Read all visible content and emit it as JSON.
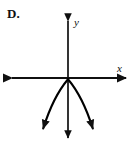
{
  "figure": {
    "choice_label": "D.",
    "colors": {
      "ink": "#101010",
      "background": "#ffffff",
      "curve": "#000000"
    },
    "axes": {
      "x_label": "x",
      "y_label": "y",
      "origin": {
        "x": 68,
        "y": 78
      },
      "x_axis": {
        "x1": 9,
        "y1": 78,
        "x2": 129,
        "y2": 78,
        "left_arrow": true,
        "right_arrow": true
      },
      "y_axis": {
        "x1": 68,
        "y1": 18,
        "x2": 68,
        "y2": 141,
        "top_arrow": true,
        "bottom_arrow": true
      }
    },
    "curve": {
      "type": "parabola",
      "opens": "down",
      "vertex": {
        "x": 0,
        "y": 0
      },
      "equation": "y = -a x^2",
      "left_branch_arrow": true,
      "right_branch_arrow": true,
      "left_endpoint": {
        "x": 41,
        "y": 140
      },
      "right_endpoint": {
        "x": 95,
        "y": 140
      },
      "path": "M 41.5 133 C 45.5 115 54.5 93 68 79.5 C 81.5 93 90.5 115 94.5 133"
    }
  }
}
